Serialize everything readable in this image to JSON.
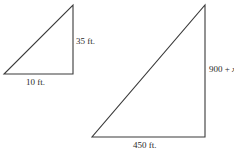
{
  "figure": {
    "stroke_color": "#3a3a3a",
    "background": "#ffffff"
  },
  "small_triangle": {
    "vertices": {
      "bottom_left": [
        4,
        74
      ],
      "bottom_right": [
        73,
        74
      ],
      "top": [
        73,
        5
      ]
    },
    "base_label": "10 ft.",
    "height_label": "35 ft."
  },
  "large_triangle": {
    "vertices": {
      "bottom_left": [
        92,
        137
      ],
      "bottom_right": [
        205,
        137
      ],
      "top": [
        205,
        5
      ]
    },
    "base_label": "450 ft.",
    "height_label_prefix": "900 + ",
    "height_label_variable": "x"
  }
}
